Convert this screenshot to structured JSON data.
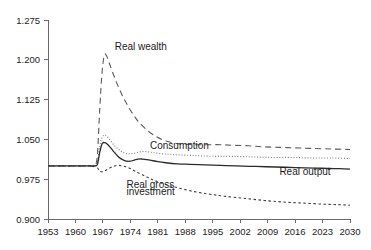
{
  "chart_data": {
    "type": "line",
    "title": "",
    "xlabel": "",
    "ylabel": "",
    "xlim": [
      1953,
      2030
    ],
    "ylim": [
      0.9,
      1.275
    ],
    "grid": false,
    "legend": "inline-annotations",
    "xticks": [
      "1953",
      "1960",
      "1967",
      "1974",
      "1981",
      "1988",
      "1995",
      "2002",
      "2009",
      "2016",
      "2023",
      "2030"
    ],
    "yticks": [
      "0.900",
      "0.975",
      "1.050",
      "1.125",
      "1.200",
      "1.275"
    ],
    "annotations": [
      {
        "key": "real_wealth",
        "text": "Real wealth",
        "x": 1970,
        "y": 1.218
      },
      {
        "key": "consumption",
        "text": "Consumption",
        "x": 1979,
        "y": 1.031
      },
      {
        "key": "real_output",
        "text": "Real output",
        "x": 2012,
        "y": 0.982
      },
      {
        "key": "real_gross_investment_1",
        "text": "Real gross",
        "x": 1973,
        "y": 0.958
      },
      {
        "key": "real_gross_investment_2",
        "text": "investment",
        "x": 1973,
        "y": 0.945
      }
    ],
    "series": [
      {
        "name": "Real wealth",
        "style": "long-dashed",
        "color": "#5a5a5a",
        "x": [
          1953,
          1956,
          1959,
          1962,
          1964,
          1965,
          1965.6,
          1966.2,
          1966.8,
          1967.4,
          1968,
          1969,
          1970,
          1971,
          1972,
          1973,
          1974,
          1975,
          1976,
          1978,
          1980,
          1982,
          1984,
          1986,
          1988,
          1991,
          1994,
          1997,
          2000,
          2004,
          2008,
          2012,
          2016,
          2020,
          2025,
          2030
        ],
        "y": [
          1.0,
          1.0,
          1.0,
          1.0,
          1.0,
          1.0,
          1.022,
          1.108,
          1.178,
          1.209,
          1.206,
          1.186,
          1.166,
          1.148,
          1.132,
          1.118,
          1.105,
          1.094,
          1.084,
          1.069,
          1.058,
          1.05,
          1.045,
          1.042,
          1.041,
          1.04,
          1.04,
          1.04,
          1.039,
          1.038,
          1.036,
          1.035,
          1.034,
          1.033,
          1.032,
          1.031
        ]
      },
      {
        "name": "Consumption",
        "style": "dotted",
        "color": "#7b7b7b",
        "x": [
          1953,
          1958,
          1962,
          1964,
          1965,
          1965.6,
          1966.2,
          1966.8,
          1967.4,
          1968,
          1969,
          1970,
          1971,
          1972,
          1973,
          1974,
          1975,
          1976,
          1977,
          1978,
          1979,
          1980,
          1982,
          1984,
          1986,
          1989,
          1992,
          1996,
          2000,
          2005,
          2010,
          2015,
          2020,
          2025,
          2030
        ],
        "y": [
          1.0,
          1.0,
          1.0,
          1.0,
          1.0,
          1.008,
          1.038,
          1.054,
          1.058,
          1.056,
          1.047,
          1.038,
          1.031,
          1.026,
          1.023,
          1.023,
          1.024,
          1.026,
          1.027,
          1.027,
          1.026,
          1.025,
          1.023,
          1.022,
          1.021,
          1.02,
          1.019,
          1.018,
          1.018,
          1.017,
          1.016,
          1.016,
          1.015,
          1.015,
          1.014
        ]
      },
      {
        "name": "Real output",
        "style": "solid",
        "color": "#2b2b2b",
        "x": [
          1953,
          1958,
          1962,
          1964,
          1965,
          1965.6,
          1966.2,
          1966.8,
          1967.4,
          1968,
          1969,
          1970,
          1971,
          1972,
          1973,
          1974,
          1975,
          1976,
          1977,
          1978,
          1979,
          1981,
          1983,
          1986,
          1989,
          1993,
          1997,
          2001,
          2006,
          2011,
          2016,
          2021,
          2026,
          2030
        ],
        "y": [
          1.0,
          1.0,
          1.0,
          1.0,
          1.0,
          1.003,
          1.026,
          1.042,
          1.044,
          1.042,
          1.034,
          1.025,
          1.017,
          1.012,
          1.009,
          1.009,
          1.011,
          1.013,
          1.013,
          1.012,
          1.011,
          1.008,
          1.006,
          1.004,
          1.003,
          1.002,
          1.001,
          1.0,
          0.999,
          0.998,
          0.997,
          0.996,
          0.995,
          0.994
        ]
      },
      {
        "name": "Real gross investment",
        "style": "short-dashed",
        "color": "#3d3d3d",
        "x": [
          1953,
          1958,
          1962,
          1964,
          1965,
          1965.6,
          1966.2,
          1967,
          1968,
          1969,
          1970,
          1971,
          1972,
          1973,
          1974,
          1975,
          1976,
          1978,
          1980,
          1983,
          1986,
          1990,
          1994,
          1998,
          2003,
          2008,
          2013,
          2018,
          2023,
          2027,
          2030
        ],
        "y": [
          1.0,
          1.0,
          1.0,
          1.0,
          1.0,
          0.997,
          0.99,
          0.989,
          0.993,
          0.997,
          1.0,
          1.001,
          1.0,
          0.998,
          0.995,
          0.991,
          0.987,
          0.98,
          0.973,
          0.965,
          0.959,
          0.952,
          0.947,
          0.943,
          0.939,
          0.935,
          0.932,
          0.93,
          0.928,
          0.927,
          0.926
        ]
      }
    ]
  },
  "plot": {
    "geometry": {
      "left": 48,
      "right": 350,
      "top": 20,
      "bottom": 219
    }
  }
}
